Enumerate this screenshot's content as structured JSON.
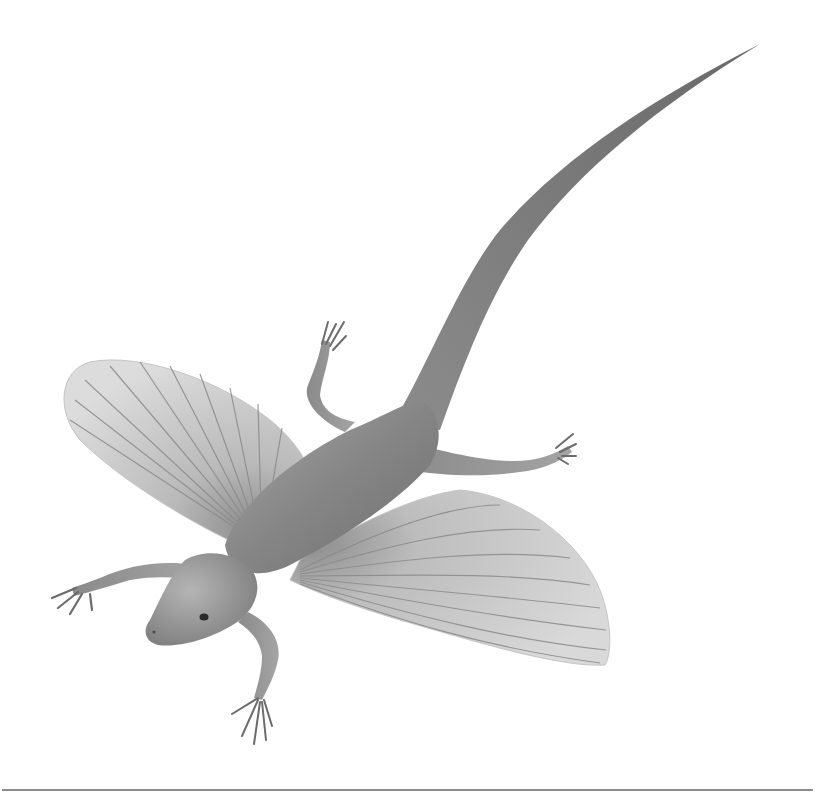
{
  "image": {
    "subject": "gliding reptile illustration",
    "description": "Grayscale illustration of a gliding lizard-like reptile viewed from above with two ribbed fan-shaped wing membranes, four limbs with clawed digits, and a long tapering tail curving to the upper right",
    "palette": {
      "background": "#ffffff",
      "body_dark": "#6e6e6e",
      "body_mid": "#8f8f8f",
      "body_light": "#b8b8b8",
      "wing_fill": "#d2d2d2",
      "wing_rib": "#8a8a8a",
      "rule": "#8c8c8c"
    },
    "parts": [
      "head",
      "eye",
      "left-wing",
      "right-wing",
      "body",
      "tail",
      "left-foreleg",
      "right-foreleg",
      "left-hindleg",
      "right-hindleg"
    ]
  },
  "footer": {
    "rule": true
  }
}
